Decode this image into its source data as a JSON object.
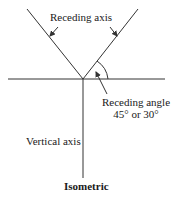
{
  "diagram": {
    "title": "Isometric",
    "labels": {
      "receding_axis": "Receding axis",
      "receding_angle_line1": "Receding angle",
      "receding_angle_line2": "45° or 30°",
      "vertical_axis": "Vertical axis"
    },
    "colors": {
      "line": "#333333",
      "background": "#ffffff"
    }
  }
}
